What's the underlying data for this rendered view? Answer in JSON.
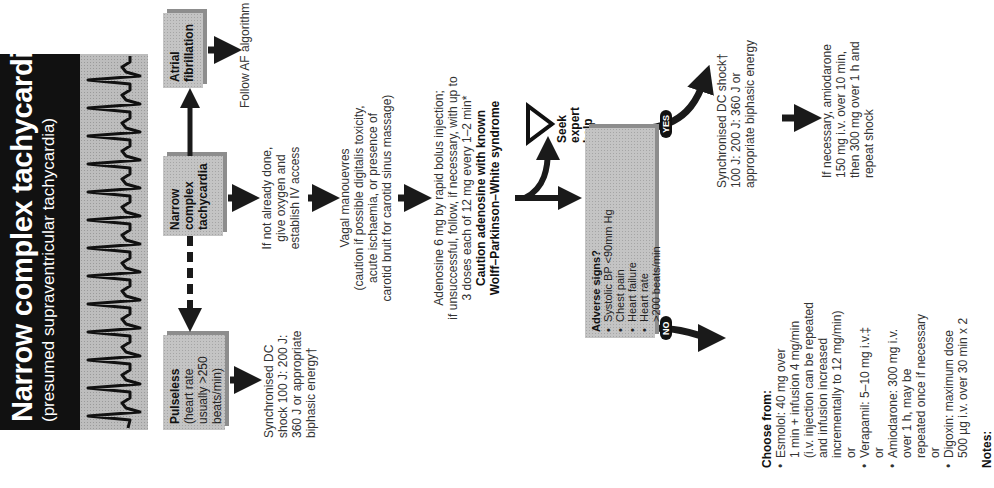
{
  "title": {
    "main": "Narrow complex tachycardia",
    "subtitle": "(presumed supraventricular tachycardia)"
  },
  "boxes": {
    "pulseless": {
      "heading": "Pulseless",
      "lines": [
        "(heart rate",
        "usually >250",
        "beats/min)"
      ]
    },
    "narrow_complex": {
      "lines": [
        "Narrow",
        "complex",
        "tachycardia"
      ]
    },
    "atrial_fibrillation": {
      "lines": [
        "Atrial",
        "fibrillation"
      ]
    },
    "adverse_signs": {
      "heading": "Adverse signs?",
      "items": [
        "Systolic BP <90mm Hg",
        "Chest pain",
        "Heart failure",
        "Heart rate",
        ">200 beats/min"
      ]
    }
  },
  "steps": {
    "follow_af": "Follow AF algorithm",
    "pulseless_action": [
      "Synchronised DC",
      "shock 100 J: 200 J:",
      "360 J or appropriate",
      "biphasic energy†"
    ],
    "oxygen_iv": [
      "If not already done,",
      "give oxygen and",
      "establish IV access"
    ],
    "vagal": [
      "Vagal manouevres",
      "(caution if possible digitalis toxicity,",
      "acute ischaemia, or presence of",
      "carotid bruit for carotid sinus massage)"
    ],
    "adenosine": [
      "Adenosine 6 mg by rapid bolus injection;",
      "if unsuccessful, follow, if necessary, with up to",
      "3 doses each of 12 mg every 1–2 min*"
    ],
    "adenosine_caution": [
      "Caution adenosine with known",
      "Wolff–Parkinson–White syndrome"
    ],
    "seek_help": [
      "Seek",
      "expert",
      "help"
    ],
    "yes_label": "YES",
    "no_label": "NO",
    "yes_action": [
      "Synchronised DC shock†",
      "100 J: 200 J: 360 J or",
      "appropriate biphasic energy"
    ],
    "yes_followup": [
      "If necessary, amiodarone",
      "150 mg i.v. over 10 min,",
      "then 300 mg over 1 h and",
      "repeat shock"
    ],
    "choose_from": {
      "heading": "Choose from:",
      "options": [
        {
          "lines": [
            "Esmolol: 40 mg over",
            "1 min + infusion 4 mg/min",
            "(i.v. injection can be repeated",
            "and infusion increased",
            "incrementally to 12 mg/min)"
          ]
        },
        {
          "lines": [
            "Verapamil: 5–10 mg i.v.‡"
          ]
        },
        {
          "lines": [
            "Amiodarone: 300 mg i.v.",
            "over 1 h, may be",
            "repeated once if necessary"
          ]
        },
        {
          "lines": [
            "Digoxin: maximum dose",
            "500 µg i.v. over 30 min x 2"
          ]
        }
      ],
      "separator": "or"
    },
    "notes_heading": "Notes:"
  },
  "icons": {
    "warning": "warning-triangle-icon"
  },
  "colors": {
    "title_bg": "#111111",
    "box_fill": "#c4c4c4",
    "box_shadow": "#8d8d8d",
    "arrow": "#1a1a1a"
  }
}
